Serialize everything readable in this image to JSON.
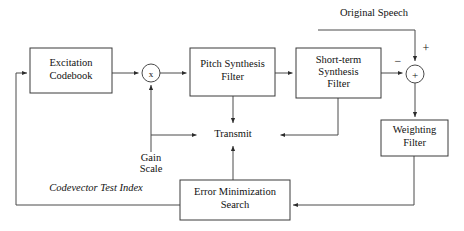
{
  "diagram": {
    "width": 464,
    "height": 231,
    "background_color": "#ffffff",
    "line_color": "#4a4a4a",
    "box_stroke_color": "#3a3a3a",
    "text_color": "#111111"
  },
  "blocks": [
    {
      "id": "excitation-codebook",
      "label_line1": "Excitation",
      "label_line2": "Codebook",
      "x": 30,
      "y": 48,
      "w": 82,
      "h": 45
    },
    {
      "id": "pitch-synthesis-filter",
      "label_line1": "Pitch Synthesis",
      "label_line2": "Filter",
      "x": 190,
      "y": 48,
      "w": 85,
      "h": 48
    },
    {
      "id": "short-term-synthesis-filter",
      "label_line1": "Short-term",
      "label_line2": "Synthesis",
      "label_line3": "Filter",
      "x": 296,
      "y": 48,
      "w": 85,
      "h": 50
    },
    {
      "id": "weighting-filter",
      "label_line1": "Weighting",
      "label_line2": "Filter",
      "x": 381,
      "y": 120,
      "w": 67,
      "h": 36
    },
    {
      "id": "error-minimization-search",
      "label_line1": "Error Minimization",
      "label_line2": "Search",
      "x": 180,
      "y": 180,
      "w": 110,
      "h": 40
    }
  ],
  "nodes": [
    {
      "id": "gain-multiplier",
      "glyph": "x",
      "glyph_name": "multiply-operator",
      "cx": 151,
      "cy": 73,
      "r": 9
    },
    {
      "id": "error-summer",
      "glyph": "+",
      "glyph_name": "plus-operator",
      "cx": 415,
      "cy": 74,
      "r": 9
    }
  ],
  "labels": [
    {
      "id": "original-speech",
      "text": "Original Speech",
      "x": 374,
      "y": 14,
      "italic": false
    },
    {
      "id": "transmit",
      "text": "Transmit",
      "x": 233,
      "y": 135,
      "italic": false
    },
    {
      "id": "gain-scale-line1",
      "text": "Gain",
      "x": 151,
      "y": 159,
      "italic": false
    },
    {
      "id": "gain-scale-line2",
      "text": "Scale",
      "x": 151,
      "y": 170,
      "italic": false
    },
    {
      "id": "codevector-test-index",
      "text": "Codevector Test Index",
      "x": 96,
      "y": 189,
      "italic": true
    }
  ],
  "signs": [
    {
      "id": "plus-sign-original-speech",
      "text": "+",
      "x": 426,
      "y": 49
    },
    {
      "id": "minus-sign-synthesized",
      "text": "−",
      "x": 398,
      "y": 62
    }
  ],
  "connections": [
    {
      "id": "codebook-to-multiplier",
      "from": "excitation-codebook",
      "to": "gain-multiplier",
      "path": "M112,73 L140,73",
      "arrow_at": "140,73",
      "arrow_dir": "right"
    },
    {
      "id": "multiplier-to-pitch-filter",
      "from": "gain-multiplier",
      "to": "pitch-synthesis-filter",
      "path": "M160,73 L188,73",
      "arrow_at": "188,73",
      "arrow_dir": "right"
    },
    {
      "id": "pitch-filter-to-short-term-filter",
      "from": "pitch-synthesis-filter",
      "to": "short-term-synthesis-filter",
      "path": "M275,73 L294,73",
      "arrow_at": "294,73",
      "arrow_dir": "right"
    },
    {
      "id": "short-term-filter-to-summer",
      "from": "short-term-synthesis-filter",
      "to": "error-summer",
      "path": "M381,73 L404,73",
      "arrow_at": "404,73",
      "arrow_dir": "right"
    },
    {
      "id": "original-speech-to-summer",
      "from": "original-speech",
      "to": "error-summer",
      "path": "M318,30 L415,30 L415,62",
      "arrow_at": "415,62",
      "arrow_dir": "down"
    },
    {
      "id": "summer-to-weighting-filter",
      "from": "error-summer",
      "to": "weighting-filter",
      "path": "M415,83 L415,118",
      "arrow_at": "415,118",
      "arrow_dir": "down"
    },
    {
      "id": "weighting-filter-to-error-search",
      "from": "weighting-filter",
      "to": "error-minimization-search",
      "path": "M414,156 L414,205 L292,205",
      "arrow_at": "292,205",
      "arrow_dir": "left"
    },
    {
      "id": "error-search-to-codebook",
      "from": "error-minimization-search",
      "to": "excitation-codebook",
      "path": "M180,205 L16,205 L16,73 L28,73",
      "arrow_at": "28,73",
      "arrow_dir": "right"
    },
    {
      "id": "error-search-to-transmit",
      "from": "error-minimization-search",
      "to": "transmit",
      "path": "M233,180 L233,145",
      "arrow_at": "233,145",
      "arrow_dir": "up"
    },
    {
      "id": "pitch-filter-to-transmit",
      "from": "pitch-synthesis-filter",
      "to": "transmit",
      "path": "M233,96 L233,124",
      "arrow_at": "233,124",
      "arrow_dir": "down"
    },
    {
      "id": "short-term-filter-to-transmit",
      "from": "short-term-synthesis-filter",
      "to": "transmit",
      "path": "M338,98 L338,135 L279,135",
      "arrow_at": "279,135",
      "arrow_dir": "left"
    },
    {
      "id": "gain-scale-to-transmit",
      "from": "gain-scale",
      "to": "transmit",
      "path": "M151,135 L198,135",
      "arrow_at": "198,135",
      "arrow_dir": "right"
    },
    {
      "id": "gain-scale-to-multiplier",
      "from": "gain-scale",
      "to": "gain-multiplier",
      "path": "M151,152 L151,84",
      "arrow_at": "151,84",
      "arrow_dir": "up"
    }
  ]
}
